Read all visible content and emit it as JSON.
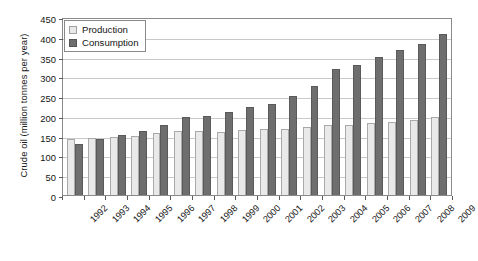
{
  "chart_data": {
    "type": "bar",
    "title": "",
    "xlabel": "",
    "ylabel": "Crude oil (million tonnes per year)",
    "ylim": [
      0,
      450
    ],
    "ytick_step": 50,
    "yticks": [
      0,
      50,
      100,
      150,
      200,
      250,
      300,
      350,
      400,
      450
    ],
    "grid": true,
    "grid_axis": "y",
    "legend_position": "top-left",
    "xtick_rotation": -45,
    "categories": [
      "1992",
      "1993",
      "1994",
      "1995",
      "1996",
      "1997",
      "1998",
      "1999",
      "2000",
      "2001",
      "2002",
      "2003",
      "2004",
      "2005",
      "2006",
      "2007",
      "2008",
      "2009"
    ],
    "series": [
      {
        "name": "Production",
        "color": "#e9e9e9",
        "values": [
          142,
          144,
          146,
          150,
          158,
          161,
          161,
          159,
          165,
          166,
          167,
          172,
          177,
          178,
          182,
          185,
          190,
          198
        ]
      },
      {
        "name": "Consumption",
        "color": "#6e6e6e",
        "values": [
          128,
          141,
          152,
          163,
          176,
          197,
          199,
          211,
          223,
          229,
          250,
          275,
          318,
          328,
          348,
          366,
          382,
          408
        ]
      }
    ]
  },
  "legend": {
    "items": [
      {
        "label": "Production",
        "swatch": "production"
      },
      {
        "label": "Consumption",
        "swatch": "consumption"
      }
    ]
  }
}
